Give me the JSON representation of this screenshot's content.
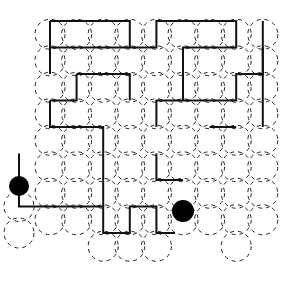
{
  "colors": {
    "path": "#111111",
    "circles": "#222222",
    "dots": "#000000",
    "background": "#ffffff"
  },
  "grid": {
    "columns_x": [
      19,
      50,
      78,
      104,
      130,
      155,
      183,
      210,
      235,
      264
    ],
    "rows_y": [
      21,
      47,
      73,
      100,
      127,
      155,
      183,
      211,
      243,
      270
    ]
  },
  "markers": {
    "start": {
      "name": "start-dot",
      "col": 0,
      "row": 6.1
    },
    "end": {
      "name": "end-dot",
      "col": 6,
      "row": 7
    }
  },
  "path_points": [
    [
      0,
      6
    ],
    [
      0,
      8
    ],
    [
      2,
      8
    ],
    [
      2,
      9
    ],
    [
      3,
      9
    ],
    [
      3,
      8
    ],
    [
      4,
      8
    ],
    [
      4,
      9
    ],
    [
      5,
      9
    ],
    [
      5,
      8
    ],
    [
      7,
      8
    ],
    [
      7,
      9
    ],
    [
      8,
      9
    ],
    [
      8,
      8
    ],
    [
      9,
      8
    ],
    [
      9,
      7
    ],
    [
      7,
      7
    ],
    [
      7,
      5
    ],
    [
      8,
      5
    ],
    [
      8,
      4
    ],
    [
      9,
      4
    ],
    [
      9,
      0
    ],
    [
      8,
      0
    ],
    [
      8,
      3
    ],
    [
      7,
      3
    ],
    [
      7,
      2
    ],
    [
      6,
      2
    ],
    [
      6,
      3
    ],
    [
      5,
      3
    ],
    [
      5,
      4
    ],
    [
      4,
      4
    ],
    [
      4,
      5
    ],
    [
      3,
      5
    ],
    [
      3,
      6
    ],
    [
      1,
      6
    ],
    [
      1,
      4
    ],
    [
      2,
      4
    ],
    [
      2,
      5
    ],
    [
      3,
      5
    ]
  ],
  "path_segments": [
    [
      [
        0,
        6
      ],
      [
        0,
        8
      ],
      [
        3.0,
        8
      ],
      [
        3.0,
        9
      ],
      [
        4,
        9
      ],
      [
        4,
        8
      ],
      [
        5,
        8
      ],
      [
        5,
        9
      ],
      [
        5.7,
        9
      ]
    ],
    [
      [
        1,
        1
      ],
      [
        4,
        1
      ],
      [
        4,
        2
      ],
      [
        5,
        2
      ],
      [
        5,
        1
      ],
      [
        8,
        1
      ],
      [
        8,
        2
      ],
      [
        6,
        2
      ],
      [
        6,
        4
      ]
    ],
    [
      [
        1,
        1
      ],
      [
        1,
        2
      ],
      [
        4,
        2
      ]
    ],
    [
      [
        2,
        3
      ],
      [
        4,
        3
      ],
      [
        4,
        4
      ]
    ],
    [
      [
        1,
        4
      ],
      [
        2,
        4
      ],
      [
        2,
        3
      ]
    ],
    [
      [
        1,
        4
      ],
      [
        1,
        5
      ],
      [
        3,
        5
      ],
      [
        3,
        8
      ]
    ],
    [
      [
        1,
        3
      ],
      [
        1,
        2
      ]
    ],
    [
      [
        5,
        6
      ],
      [
        5,
        7
      ],
      [
        6,
        7
      ]
    ],
    [
      [
        5,
        5
      ],
      [
        5,
        4
      ],
      [
        8,
        4
      ],
      [
        8,
        3
      ],
      [
        9,
        3
      ],
      [
        9,
        2
      ]
    ],
    [
      [
        8,
        5
      ],
      [
        7,
        5
      ]
    ],
    [
      [
        9,
        1
      ],
      [
        9,
        5
      ]
    ]
  ]
}
